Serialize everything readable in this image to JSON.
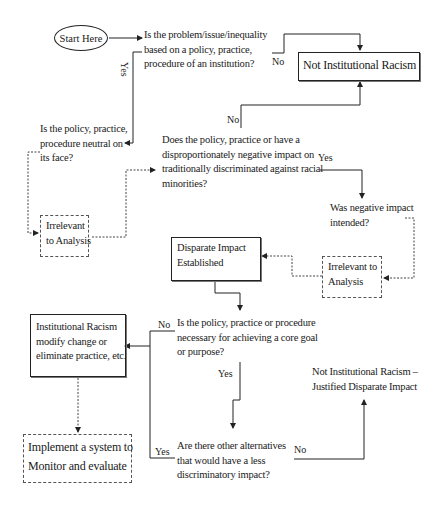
{
  "diagram": {
    "type": "flowchart",
    "start": "Start Here",
    "questions": {
      "q1": [
        "Is the problem/issue/inequality",
        "based on a policy, practice,",
        "procedure of an institution?"
      ],
      "q2": [
        "Is the policy, practice,",
        "procedure neutral on",
        "its face?"
      ],
      "q3": [
        "Does the policy, practice or have a",
        "disproportionately negative impact on",
        "traditionally discriminated against racial",
        "minorities?"
      ],
      "q4": [
        "Was negative impact",
        "intended?"
      ],
      "q5": [
        "Is the policy, practice or procedure",
        "necessary for achieving a core goal",
        "or purpose?"
      ],
      "q6": [
        "Are there other alternatives",
        "that would have a less",
        "discriminatory impact?"
      ]
    },
    "outcomes": {
      "not_ir": "Not Institutional Racism",
      "irrelevant_1": [
        "Irrelevant",
        "to Analysis"
      ],
      "irrelevant_2": [
        "Irrelevant to",
        "Analysis"
      ],
      "disparate": [
        "Disparate Impact",
        "Established"
      ],
      "ir": [
        "Institutional Racism",
        "modify change or",
        "eliminate practice, etc."
      ],
      "implement": [
        "Implement a system to",
        "Monitor and evaluate"
      ],
      "justified": [
        "Not Institutional Racism –",
        "Justified Disparate Impact"
      ]
    },
    "edge_labels": {
      "q1_no": "No",
      "q1_yes": "Yes",
      "q3_no": "No",
      "q3_yes": "Yes",
      "q5_no": "No",
      "q5_yes": "Yes",
      "q6_yes": "Yes",
      "q6_no": "No"
    }
  }
}
